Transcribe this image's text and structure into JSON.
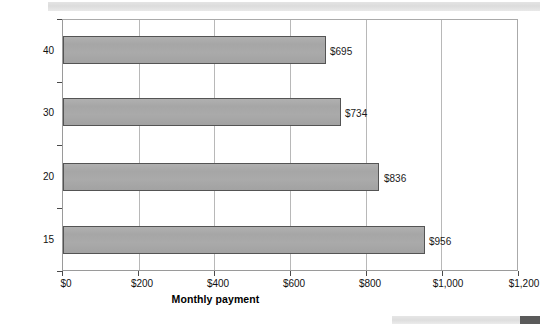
{
  "decorations": {
    "top_band": "scan-artifact-band",
    "bottom_band": "scan-artifact-band",
    "bottom_block": "scan-artifact-block"
  },
  "chart_data": {
    "type": "bar",
    "orientation": "horizontal",
    "title": "",
    "xlabel": "Monthly payment",
    "ylabel": "Mortgage term (years)",
    "categories": [
      "40",
      "30",
      "20",
      "15"
    ],
    "values": [
      695,
      734,
      836,
      956
    ],
    "data_labels": [
      "$695",
      "$734",
      "$836",
      "$956"
    ],
    "xlim": [
      0,
      1200
    ],
    "ylim": [
      0,
      4
    ],
    "xticks": [
      0,
      200,
      400,
      600,
      800,
      1000,
      1200
    ],
    "xticklabels": [
      "$0",
      "$200",
      "$400",
      "$600",
      "$800",
      "$1,000",
      "$1,200"
    ],
    "yticklabels": [
      "40",
      "30",
      "20",
      "15"
    ],
    "gridlines": {
      "vertical": [
        200,
        400,
        600,
        800,
        1000
      ],
      "horizontal": []
    },
    "grid": true,
    "legend": null,
    "bar_color": "#a8a8a8",
    "bar_edge_color": "#545454",
    "axis_color": "#9a9a9a",
    "grid_color": "#b8b8b8",
    "text_color": "#111111"
  }
}
